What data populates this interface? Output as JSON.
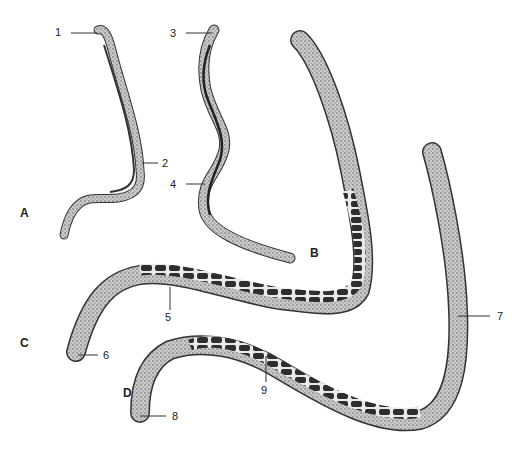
{
  "figure": {
    "panels": [
      {
        "id": "A",
        "label": "A"
      },
      {
        "id": "B",
        "label": "B"
      },
      {
        "id": "C",
        "label": "C"
      },
      {
        "id": "D",
        "label": "D"
      }
    ],
    "callouts": [
      {
        "n": "1"
      },
      {
        "n": "2"
      },
      {
        "n": "3"
      },
      {
        "n": "4"
      },
      {
        "n": "5"
      },
      {
        "n": "6"
      },
      {
        "n": "7"
      },
      {
        "n": "8"
      },
      {
        "n": "9"
      }
    ],
    "colors": {
      "ink": "#222222",
      "body_fill": "#b8b8b8",
      "gut_fill": "#3a3a3a",
      "background": "#ffffff"
    }
  }
}
